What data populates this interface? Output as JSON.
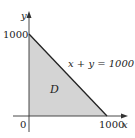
{
  "figure": {
    "type": "region-diagram",
    "axes": {
      "x_label": "x",
      "y_label": "y",
      "origin_label": "0",
      "x_tick_label": "1000",
      "y_tick_label": "1000"
    },
    "region": {
      "label": "D",
      "fill_color": "#d4d4d4",
      "vertices": [
        [
          0,
          0
        ],
        [
          1000,
          0
        ],
        [
          0,
          1000
        ]
      ]
    },
    "line": {
      "equation_label": "x + y = 1000",
      "color": "#222222"
    }
  }
}
